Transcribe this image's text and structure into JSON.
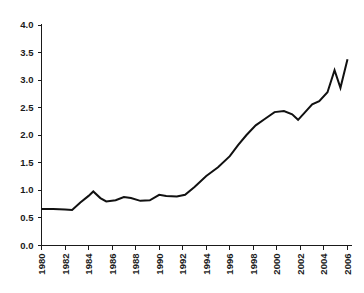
{
  "chart_data": {
    "type": "line",
    "title": "",
    "subtitle": "",
    "xlabel": "",
    "ylabel": "",
    "grid": false,
    "legend": null,
    "legend_position": "none",
    "xlim": [
      1980,
      2006
    ],
    "ylim": [
      0.0,
      4.0
    ],
    "x_tick_step": 2,
    "y_tick_step": 0.5,
    "x_tick_labels": [
      "1980",
      "1982",
      "1984",
      "1986",
      "1988",
      "1990",
      "1992",
      "1994",
      "1996",
      "1998",
      "2000",
      "2002",
      "2004",
      "2006"
    ],
    "y_tick_labels": [
      "0.0",
      "0.5",
      "1.0",
      "1.5",
      "2.0",
      "2.5",
      "3.0",
      "3.5",
      "4.0"
    ],
    "x": [
      1980,
      1981,
      1982,
      1983,
      1984,
      1985,
      1986,
      1987,
      1988,
      1989,
      1990,
      1991,
      1992,
      1993,
      1994,
      1995,
      1996,
      1997,
      1998,
      1999,
      2000,
      2001,
      2002,
      2003,
      2004,
      2005,
      2006
    ],
    "values": [
      0.66,
      0.66,
      0.65,
      0.64,
      0.78,
      0.98,
      0.85,
      0.82,
      0.88,
      0.86,
      0.8,
      0.92,
      0.91,
      0.89,
      0.96,
      1.18,
      1.38,
      1.6,
      1.85,
      2.05,
      2.28,
      2.38,
      2.32,
      2.3,
      2.5,
      2.65,
      2.82
    ],
    "series": [
      {
        "name": "series-1",
        "color": "#111111",
        "points": [
          {
            "x": 1980.0,
            "y": 0.66
          },
          {
            "x": 1981.0,
            "y": 0.66
          },
          {
            "x": 1982.0,
            "y": 0.655
          },
          {
            "x": 1982.6,
            "y": 0.645
          },
          {
            "x": 1983.3,
            "y": 0.78
          },
          {
            "x": 1984.0,
            "y": 0.9
          },
          {
            "x": 1984.4,
            "y": 0.98
          },
          {
            "x": 1985.0,
            "y": 0.86
          },
          {
            "x": 1985.5,
            "y": 0.8
          },
          {
            "x": 1986.3,
            "y": 0.82
          },
          {
            "x": 1987.0,
            "y": 0.88
          },
          {
            "x": 1987.6,
            "y": 0.86
          },
          {
            "x": 1988.4,
            "y": 0.81
          },
          {
            "x": 1989.2,
            "y": 0.82
          },
          {
            "x": 1990.0,
            "y": 0.92
          },
          {
            "x": 1990.6,
            "y": 0.9
          },
          {
            "x": 1991.5,
            "y": 0.89
          },
          {
            "x": 1992.2,
            "y": 0.92
          },
          {
            "x": 1993.0,
            "y": 1.06
          },
          {
            "x": 1994.0,
            "y": 1.26
          },
          {
            "x": 1995.0,
            "y": 1.42
          },
          {
            "x": 1996.0,
            "y": 1.62
          },
          {
            "x": 1996.7,
            "y": 1.82
          },
          {
            "x": 1997.4,
            "y": 2.0
          },
          {
            "x": 1998.2,
            "y": 2.18
          },
          {
            "x": 1999.0,
            "y": 2.3
          },
          {
            "x": 1999.8,
            "y": 2.42
          },
          {
            "x": 2000.6,
            "y": 2.44
          },
          {
            "x": 2001.3,
            "y": 2.38
          },
          {
            "x": 2001.8,
            "y": 2.28
          },
          {
            "x": 2002.4,
            "y": 2.42
          },
          {
            "x": 2003.0,
            "y": 2.56
          },
          {
            "x": 2003.6,
            "y": 2.62
          },
          {
            "x": 2004.3,
            "y": 2.78
          },
          {
            "x": 2004.9,
            "y": 3.18
          },
          {
            "x": 2005.4,
            "y": 2.86
          },
          {
            "x": 2006.0,
            "y": 3.38
          }
        ]
      }
    ]
  }
}
